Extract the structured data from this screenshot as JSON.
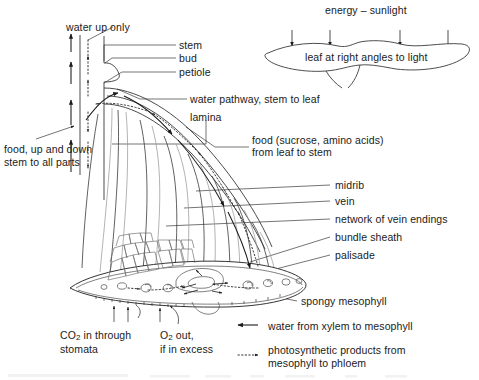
{
  "diagram": {
    "background_color": "#ffffff",
    "line_color": "#1a1a1a",
    "faint_line_color": "#9a9a9a",
    "text_color": "#1a1a1a"
  },
  "labels": {
    "water_up_only": "water up only",
    "stem": "stem",
    "bud": "bud",
    "petiole": "petiole",
    "water_pathway": "water pathway, stem to leaf",
    "lamina": "lamina",
    "food_down_line1": "food, up and down",
    "food_down_line2": "stem to all parts",
    "food_leaf_line1": "food (sucrose, amino acids)",
    "food_leaf_line2": "from leaf to stem",
    "midrib": "midrib",
    "vein": "vein",
    "network_vein_endings": "network of vein endings",
    "bundle_sheath": "bundle sheath",
    "palisade": "palisade",
    "spongy_mesophyll": "spongy mesophyll",
    "co2_line1_pre": "CO",
    "co2_line1_sub": "2",
    "co2_line1_post": " in through",
    "co2_line2": "stomata",
    "o2_line1_pre": "O",
    "o2_line1_sub": "2",
    "o2_line1_post": " out,",
    "o2_line2": "if in excess",
    "energy_sunlight": "energy – sunlight",
    "leaf_right_angles": "leaf at right angles to light"
  },
  "legend": {
    "items": [
      {
        "symbol": "solid-left-arrow",
        "text": "water from xylem to mesophyll"
      },
      {
        "symbol": "dotted-right-arrow",
        "text_line1": "photosynthetic products from",
        "text_line2": "mesophyll to phloem"
      }
    ]
  },
  "inset": {
    "arrow_count": 4,
    "arrow_label": "sunlight-arrow"
  }
}
